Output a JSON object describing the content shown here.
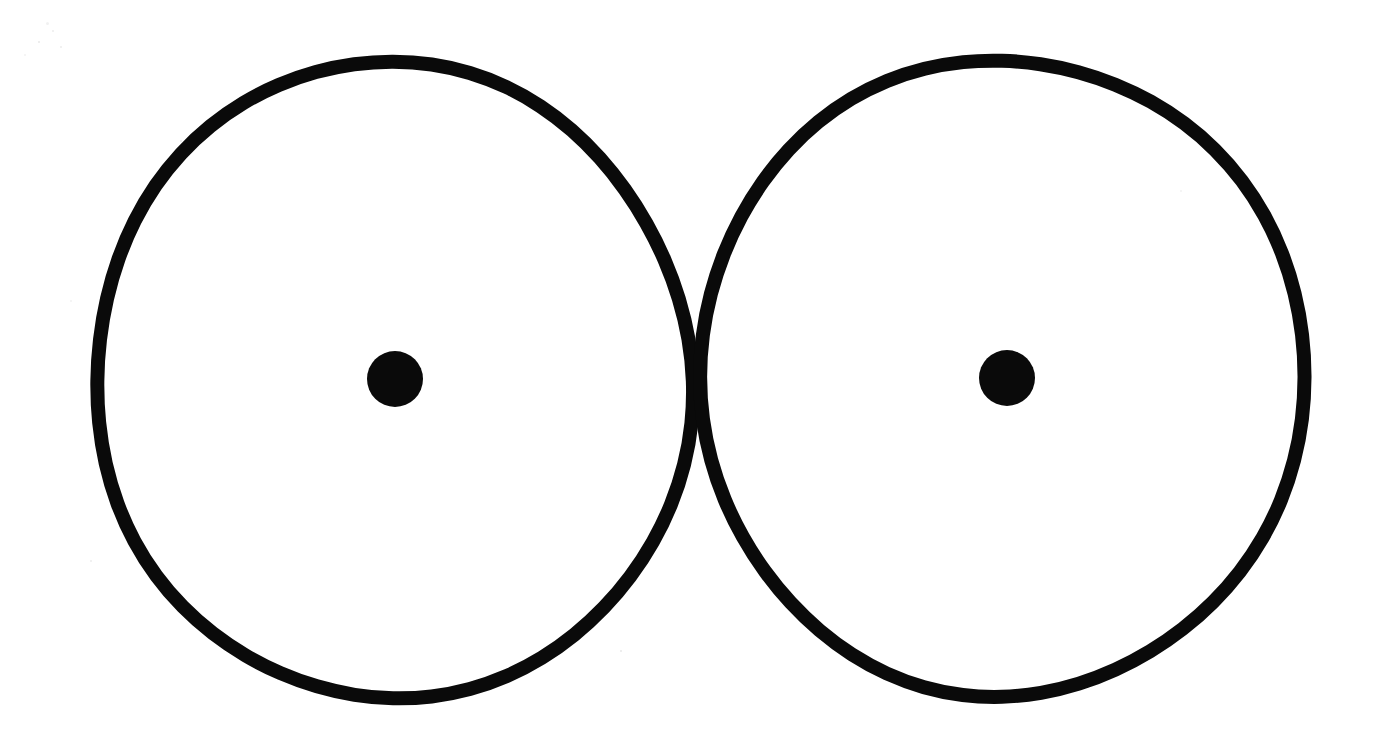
{
  "document": {
    "title": "Two Circles Drawing",
    "kind": "hand-drawn-figure",
    "background_color": "#ffffff",
    "ink_color": "#0a0a0a",
    "canvas": {
      "width": 1376,
      "height": 749
    }
  },
  "figure": {
    "description": "Two large hand-drawn open circles side by side, each with a small filled dot at its center",
    "shape_count": 2,
    "shapes": [
      {
        "name": "left-circle",
        "type": "ellipse",
        "center_x": 393,
        "center_y": 381,
        "radius_x": 297,
        "radius_y": 319,
        "stroke_width": 14,
        "fill": "none",
        "stroke": "#0a0a0a",
        "center_dot": {
          "name": "left-center-dot",
          "center_x": 395,
          "center_y": 379,
          "radius": 28,
          "fill": "#0a0a0a"
        }
      },
      {
        "name": "right-circle",
        "type": "ellipse",
        "center_x": 1002,
        "center_y": 377,
        "radius_x": 300,
        "radius_y": 320,
        "stroke_width": 14,
        "fill": "none",
        "stroke": "#0a0a0a",
        "center_dot": {
          "name": "right-center-dot",
          "center_x": 1007,
          "center_y": 378,
          "radius": 28,
          "fill": "#0a0a0a"
        }
      }
    ],
    "gap_between_circles_px": 12,
    "scan_artifacts": [
      {
        "x": 46,
        "y": 22,
        "size": 3
      },
      {
        "x": 52,
        "y": 30,
        "size": 2
      },
      {
        "x": 38,
        "y": 41,
        "size": 2
      },
      {
        "x": 24,
        "y": 54,
        "size": 2
      },
      {
        "x": 60,
        "y": 46,
        "size": 2
      },
      {
        "x": 180,
        "y": 140,
        "size": 2
      },
      {
        "x": 70,
        "y": 300,
        "size": 2
      },
      {
        "x": 90,
        "y": 560,
        "size": 2
      },
      {
        "x": 620,
        "y": 650,
        "size": 2
      },
      {
        "x": 1180,
        "y": 190,
        "size": 2
      }
    ]
  }
}
